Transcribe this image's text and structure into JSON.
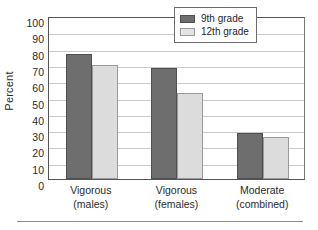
{
  "chart_data": {
    "type": "bar",
    "title": "",
    "xlabel": "",
    "ylabel": "Percent",
    "ylim": [
      0,
      100
    ],
    "ytick_step": 10,
    "grid": true,
    "legend_position": "top-right",
    "categories": [
      "Vigorous\n(males)",
      "Vigorous\n(females)",
      "Moderate\n(combined)"
    ],
    "category_lines": [
      [
        "Vigorous",
        "(males)"
      ],
      [
        "Vigorous",
        "(females)"
      ],
      [
        "Moderate",
        "(combined)"
      ]
    ],
    "series": [
      {
        "name": "9th grade",
        "values": [
          77,
          68,
          28
        ],
        "color": "#6e6e6e"
      },
      {
        "name": "12th grade",
        "values": [
          70,
          53,
          26
        ],
        "color": "#dcdcdc"
      }
    ],
    "ytick_labels": [
      "100",
      "90",
      "80",
      "70",
      "60",
      "50",
      "40",
      "30",
      "20",
      "10",
      "0"
    ],
    "ytick_values": [
      100,
      90,
      80,
      70,
      60,
      50,
      40,
      30,
      20,
      10,
      0
    ]
  },
  "legend": {
    "entries": [
      {
        "label": "9th grade"
      },
      {
        "label": "12th grade"
      }
    ]
  }
}
